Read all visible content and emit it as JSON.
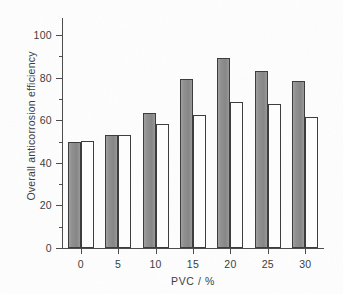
{
  "chart_data": {
    "type": "bar",
    "title": "",
    "subtitle": "",
    "xlabel": "PVC / %",
    "ylabel": "Overall anticorrosion efficiency",
    "categories": [
      "0",
      "5",
      "10",
      "15",
      "20",
      "25",
      "30"
    ],
    "series": [
      {
        "name": "series-gray",
        "fill": "#8e8e8e",
        "values": [
          50,
          53.2,
          63.5,
          79.3,
          89.2,
          83.3,
          78.6
        ]
      },
      {
        "name": "series-white",
        "fill": "#ffffff",
        "values": [
          50.2,
          53.2,
          58.4,
          62.4,
          68.5,
          67.5,
          61.6
        ]
      }
    ],
    "ylim": [
      0,
      108
    ],
    "xlim": [
      0,
      7
    ],
    "y_ticks_major": [
      0,
      20,
      40,
      60,
      80,
      100
    ],
    "y_tick_labels": [
      "0",
      "20",
      "40",
      "60",
      "80",
      "100"
    ],
    "y_ticks_minor": [
      10,
      30,
      50,
      70,
      90
    ],
    "grid": false,
    "legend": null,
    "legend_position": "none",
    "annotations": []
  },
  "figure": {
    "background_color": "#ffffff",
    "axis_color": "#4a4a4a",
    "text_color": "#3a3a3a",
    "bar_edge_color": "#3d3d3d"
  }
}
